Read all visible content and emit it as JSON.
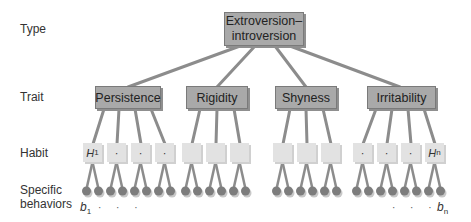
{
  "levels": {
    "type": "Type",
    "trait": "Trait",
    "habit": "Habit",
    "behaviors_line1": "Specific",
    "behaviors_line2": "behaviors"
  },
  "type_node": {
    "line1": "Extroversion–",
    "line2": "introversion"
  },
  "traits": [
    {
      "label": "Persistence"
    },
    {
      "label": "Rigidity"
    },
    {
      "label": "Shyness"
    },
    {
      "label": "Irritability"
    }
  ],
  "habits": {
    "first": {
      "symbol": "H",
      "sub": "1"
    },
    "last": {
      "symbol": "H",
      "sub": "n"
    },
    "ellipsis": "·"
  },
  "behaviors": {
    "first": {
      "symbol": "b",
      "sub": "1"
    },
    "last": {
      "symbol": "b",
      "sub": "n"
    },
    "ellipsis": "· · ·"
  },
  "colors": {
    "node_fill": "#a9a9a9",
    "habit_fill": "#e2e2e2",
    "line": "#8c8c8c",
    "dot": "#7d7d7d"
  }
}
